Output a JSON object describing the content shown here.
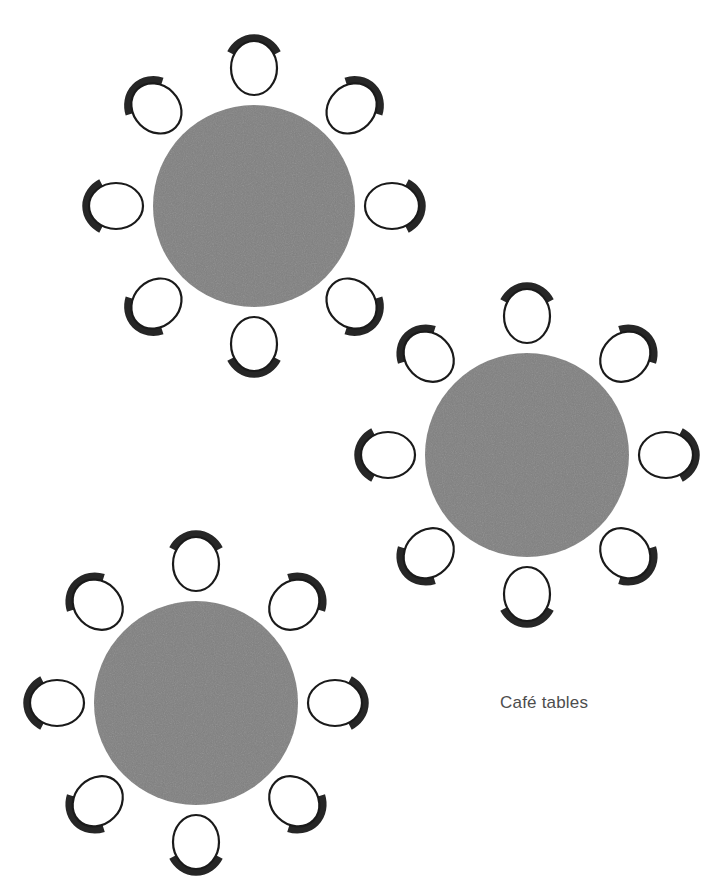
{
  "canvas": {
    "width": 720,
    "height": 892,
    "background_color": "#ffffff"
  },
  "diagram": {
    "title": "Café tables",
    "colors": {
      "table_fill": "#808080",
      "chair_seat_fill": "#ffffff",
      "chair_seat_stroke": "#1a1a1a",
      "chair_back_stroke": "#262626",
      "caption_text": "#4d4d4d"
    }
  },
  "caption": {
    "text": "Café tables",
    "x": 500,
    "y": 693,
    "font_size": 17,
    "color": "#4d4d4d"
  },
  "tables": [
    {
      "name": "table-1",
      "label": "Table 1",
      "cx": 254,
      "cy": 206,
      "radius": 101,
      "chair_count": 8,
      "chair_orbit": 138,
      "rotation_offset": 0
    },
    {
      "name": "table-2",
      "label": "Table 2",
      "cx": 527,
      "cy": 455,
      "radius": 102,
      "chair_count": 8,
      "chair_orbit": 139,
      "rotation_offset": 0
    },
    {
      "name": "table-3",
      "label": "Table 3",
      "cx": 196,
      "cy": 703,
      "radius": 102,
      "chair_count": 8,
      "chair_orbit": 139,
      "rotation_offset": 0
    }
  ],
  "chair": {
    "seat_rx": 23,
    "seat_ry": 27,
    "seat_stroke_width": 2.2,
    "back_rx": 27,
    "back_ry": 30,
    "back_stroke_width": 7.5,
    "back_sweep_degrees": 120
  }
}
